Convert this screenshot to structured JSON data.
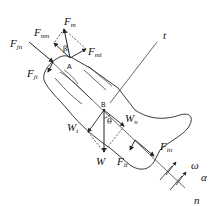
{
  "diagram": {
    "colors": {
      "stroke": "#222222",
      "background": "#ffffff"
    },
    "forces": {
      "Fm": {
        "base": "F",
        "sub": "m"
      },
      "Fmn": {
        "base": "F",
        "sub": "mn"
      },
      "Fmt": {
        "base": "F",
        "sub": "mt"
      },
      "Fjn": {
        "base": "F",
        "sub": "jn"
      },
      "Fjt": {
        "base": "F",
        "sub": "jt"
      },
      "Wt": {
        "base": "W",
        "sub": "t"
      },
      "Wn": {
        "base": "W",
        "sub": "n"
      },
      "W": {
        "base": "W",
        "sub": ""
      },
      "Fin": {
        "base": "F",
        "sub": "in"
      },
      "Fit": {
        "base": "F",
        "sub": "it"
      }
    },
    "points": {
      "A": "A",
      "B": "B"
    },
    "angles": {
      "beta": "β",
      "theta": "θ"
    },
    "axes": {
      "t": "t",
      "n": "n"
    },
    "kinematics": {
      "omega": "ω",
      "alpha": "α"
    }
  }
}
